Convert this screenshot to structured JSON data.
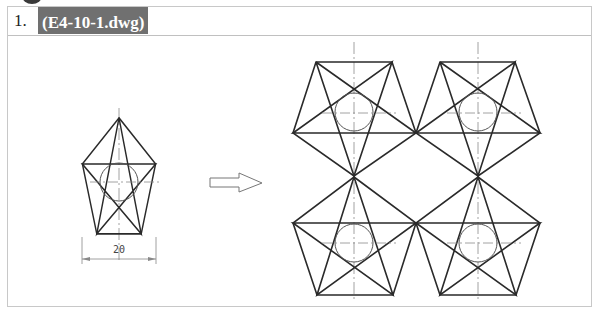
{
  "exercise": {
    "number": "1.",
    "file_label": "(E4-10-1.dwg)"
  },
  "drawing": {
    "dimension_label": "20",
    "line_color": "#2a2a2a",
    "centerline_color": "#8a8a8a",
    "header_fill": "#707070"
  }
}
